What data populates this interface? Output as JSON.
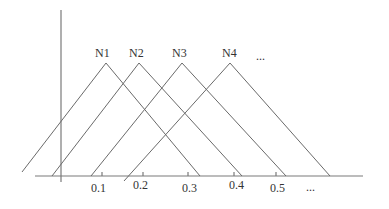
{
  "diagram": {
    "nodes": [
      {
        "label": "N1",
        "apex": [
          106,
          63
        ],
        "left_end": [
          22,
          172
        ],
        "right_end": [
          200,
          175
        ]
      },
      {
        "label": "N2",
        "apex": [
          139,
          63
        ],
        "left_end": [
          52,
          175
        ],
        "right_end": [
          242,
          175
        ]
      },
      {
        "label": "N3",
        "apex": [
          182,
          63
        ],
        "left_end": [
          91,
          175
        ],
        "right_end": [
          286,
          175
        ]
      },
      {
        "label": "N4",
        "apex": [
          230,
          63
        ],
        "left_end": [
          124,
          180
        ],
        "right_end": [
          330,
          175
        ]
      }
    ],
    "nodes_ellipsis": "...",
    "x_axis": {
      "ticks": [
        {
          "label": "0.1",
          "x": 102
        },
        {
          "label": "0.2",
          "x": 143
        },
        {
          "label": "0.3",
          "x": 188
        },
        {
          "label": "0.4",
          "x": 234
        },
        {
          "label": "0.5",
          "x": 276
        }
      ],
      "ellipsis": "..."
    },
    "line_color": "#6a6a6a",
    "text_color": "#333333"
  }
}
